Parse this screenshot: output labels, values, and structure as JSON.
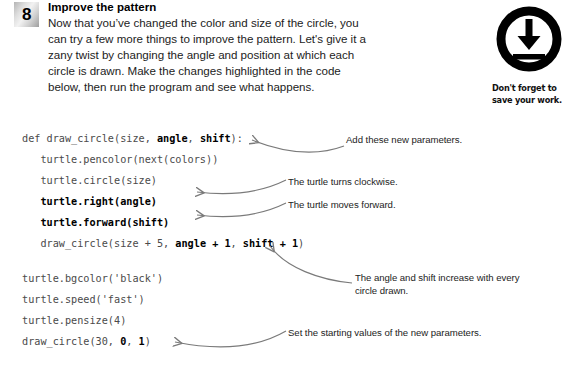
{
  "step": {
    "number": "8",
    "title": "Improve the pattern",
    "body": "Now that you’ve changed the color and size of the circle, you can try a few more things to improve the pattern. Let's give it a zany twist by changing the angle and position at which each circle is drawn. Make the changes highlighted in the code below, then run the program and see what happens."
  },
  "save_note": {
    "icon": "download-icon",
    "caption": "Don't forget to save your work."
  },
  "code": {
    "lines": [
      {
        "id": "def-line",
        "segments": [
          {
            "text": "def draw_circle(size, ",
            "bold": false
          },
          {
            "text": "angle",
            "bold": true
          },
          {
            "text": ", ",
            "bold": false
          },
          {
            "text": "shift",
            "bold": true
          },
          {
            "text": "):",
            "bold": false
          }
        ]
      },
      {
        "id": "pencolor-line",
        "segments": [
          {
            "text": "   turtle.pencolor(next(colors))",
            "bold": false
          }
        ]
      },
      {
        "id": "circle-line",
        "segments": [
          {
            "text": "   turtle.circle(size)",
            "bold": false
          }
        ]
      },
      {
        "id": "right-line",
        "segments": [
          {
            "text": "   turtle.right(angle)",
            "bold": true
          }
        ]
      },
      {
        "id": "forward-line",
        "segments": [
          {
            "text": "   turtle.forward(shift)",
            "bold": true
          }
        ]
      },
      {
        "id": "recurse-line",
        "segments": [
          {
            "text": "   draw_circle(size + 5, ",
            "bold": false
          },
          {
            "text": "angle + 1",
            "bold": true
          },
          {
            "text": ", ",
            "bold": false
          },
          {
            "text": "shift + 1",
            "bold": true
          },
          {
            "text": ")",
            "bold": false
          }
        ]
      },
      {
        "id": "blank-line",
        "blank": true,
        "segments": [
          {
            "text": " ",
            "bold": false
          }
        ]
      },
      {
        "id": "bgcolor-line",
        "segments": [
          {
            "text": "turtle.bgcolor('black')",
            "bold": false
          }
        ]
      },
      {
        "id": "speed-line",
        "segments": [
          {
            "text": "turtle.speed('fast')",
            "bold": false
          }
        ]
      },
      {
        "id": "pensize-line",
        "segments": [
          {
            "text": "turtle.pensize(4)",
            "bold": false
          }
        ]
      },
      {
        "id": "call-line",
        "segments": [
          {
            "text": "draw_circle(30, ",
            "bold": false
          },
          {
            "text": "0",
            "bold": true
          },
          {
            "text": ", ",
            "bold": false
          },
          {
            "text": "1",
            "bold": true
          },
          {
            "text": ")",
            "bold": false
          }
        ]
      }
    ]
  },
  "callouts": {
    "params": "Add these new parameters.",
    "clockwise": "The turtle turns clockwise.",
    "forward": "The turtle moves forward.",
    "increase": "The angle and shift increase with every circle drawn.",
    "starting": "Set the starting values of the new parameters."
  },
  "colors": {
    "page_background": "#ffffff",
    "text": "#1c1c1c",
    "code_text": "#4a4a4a",
    "code_highlight": "#000000",
    "arrow": "#7a7a7a",
    "badge_dark": "#9e9e9e",
    "badge_light": "#f2f2f2",
    "icon": "#000000"
  }
}
